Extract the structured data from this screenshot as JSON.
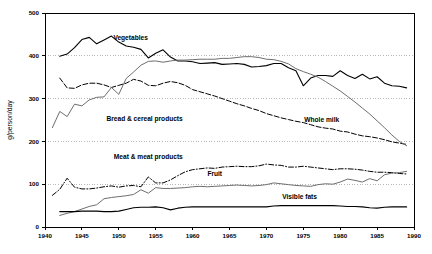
{
  "chart_data": {
    "type": "line",
    "title": "",
    "xlabel": "",
    "ylabel": "g/person/day",
    "xlim": [
      1940,
      1990
    ],
    "ylim": [
      0,
      500
    ],
    "xticks": [
      1940,
      1945,
      1950,
      1955,
      1960,
      1965,
      1970,
      1975,
      1980,
      1985,
      1990
    ],
    "yticks": [
      0,
      100,
      200,
      300,
      400,
      500
    ],
    "xtick_labels": [
      "1940",
      "1945",
      "1950",
      "1955",
      "1960",
      "1965",
      "1970",
      "1975",
      "1980",
      "1985",
      "1990"
    ],
    "ytick_labels": [
      "0",
      "100",
      "200",
      "300",
      "400",
      "500"
    ],
    "grid": "horizontal-dotted",
    "legend": "inline-annotations",
    "series": [
      {
        "name": "Vegetables",
        "label": "Vegetables",
        "color": "#000000",
        "style": "solid",
        "width": 1.1,
        "label_x": 1951.6,
        "label_y": 437,
        "x": [
          1942,
          1943,
          1944,
          1945,
          1946,
          1947,
          1948,
          1949,
          1950,
          1951,
          1952,
          1953,
          1954,
          1955,
          1956,
          1957,
          1958,
          1959,
          1960,
          1961,
          1962,
          1963,
          1964,
          1965,
          1966,
          1967,
          1968,
          1969,
          1970,
          1971,
          1972,
          1973,
          1974,
          1975,
          1976,
          1977,
          1978,
          1979,
          1980,
          1981,
          1982,
          1983,
          1984,
          1985,
          1986,
          1987,
          1988,
          1989
        ],
        "values": [
          399,
          404,
          419,
          438,
          443,
          428,
          437,
          446,
          432,
          423,
          420,
          415,
          395,
          406,
          414,
          397,
          388,
          388,
          386,
          382,
          383,
          384,
          380,
          381,
          382,
          380,
          374,
          375,
          377,
          382,
          382,
          372,
          365,
          330,
          348,
          354,
          354,
          352,
          365,
          354,
          347,
          357,
          346,
          351,
          336,
          330,
          329,
          325
        ]
      },
      {
        "name": "Bread & cereal products",
        "label": "Bread & cereal products",
        "color": "#000000",
        "style": "dashed",
        "width": 1.0,
        "label_x": 1953.5,
        "label_y": 248,
        "x": [
          1942,
          1943,
          1944,
          1945,
          1946,
          1947,
          1948,
          1949,
          1950,
          1951,
          1952,
          1953,
          1954,
          1955,
          1956,
          1957,
          1958,
          1959,
          1960,
          1961,
          1962,
          1963,
          1964,
          1965,
          1966,
          1967,
          1968,
          1969,
          1970,
          1971,
          1972,
          1973,
          1974,
          1975,
          1976,
          1977,
          1978,
          1979,
          1980,
          1981,
          1982,
          1983,
          1984,
          1985,
          1986,
          1987,
          1988,
          1989
        ],
        "values": [
          348,
          325,
          324,
          332,
          336,
          336,
          332,
          326,
          331,
          336,
          345,
          341,
          331,
          330,
          336,
          340,
          337,
          331,
          321,
          316,
          311,
          306,
          300,
          294,
          288,
          283,
          277,
          272,
          265,
          260,
          255,
          251,
          247,
          244,
          239,
          234,
          231,
          229,
          224,
          222,
          217,
          213,
          211,
          208,
          204,
          199,
          196,
          193
        ]
      },
      {
        "name": "Whole milk",
        "label": "Whole milk",
        "color": "#6e6e6e",
        "style": "solid",
        "width": 1.0,
        "label_x": 1977.5,
        "label_y": 246,
        "x": [
          1941,
          1942,
          1943,
          1944,
          1945,
          1946,
          1947,
          1948,
          1949,
          1950,
          1951,
          1952,
          1953,
          1954,
          1955,
          1956,
          1957,
          1958,
          1959,
          1960,
          1961,
          1962,
          1963,
          1964,
          1965,
          1966,
          1967,
          1968,
          1969,
          1970,
          1971,
          1972,
          1973,
          1974,
          1975,
          1976,
          1977,
          1978,
          1979,
          1980,
          1981,
          1982,
          1983,
          1984,
          1985,
          1986,
          1987,
          1988,
          1989
        ],
        "values": [
          232,
          270,
          258,
          287,
          283,
          297,
          303,
          304,
          326,
          310,
          347,
          362,
          378,
          387,
          388,
          385,
          388,
          390,
          390,
          391,
          392,
          392,
          392,
          394,
          394,
          396,
          398,
          398,
          396,
          392,
          391,
          387,
          381,
          370,
          363,
          357,
          350,
          340,
          329,
          318,
          305,
          292,
          278,
          264,
          248,
          232,
          215,
          200,
          190
        ]
      },
      {
        "name": "Meat & meat products",
        "label": "Meat & meat products",
        "color": "#000000",
        "style": "dashdot",
        "width": 1.0,
        "label_x": 1954.0,
        "label_y": 160,
        "x": [
          1941,
          1942,
          1943,
          1944,
          1945,
          1946,
          1947,
          1948,
          1949,
          1950,
          1951,
          1952,
          1953,
          1954,
          1955,
          1956,
          1957,
          1958,
          1959,
          1960,
          1961,
          1962,
          1963,
          1964,
          1965,
          1966,
          1967,
          1968,
          1969,
          1970,
          1971,
          1972,
          1973,
          1974,
          1975,
          1976,
          1977,
          1978,
          1979,
          1980,
          1981,
          1982,
          1983,
          1984,
          1985,
          1986,
          1987,
          1988,
          1989
        ],
        "values": [
          74,
          88,
          114,
          93,
          89,
          89,
          91,
          94,
          96,
          93,
          96,
          97,
          94,
          117,
          103,
          103,
          110,
          120,
          129,
          134,
          136,
          138,
          137,
          140,
          141,
          142,
          141,
          141,
          143,
          147,
          145,
          144,
          140,
          140,
          142,
          140,
          138,
          136,
          134,
          136,
          136,
          135,
          133,
          130,
          128,
          128,
          127,
          125,
          124
        ]
      },
      {
        "name": "Fruit",
        "label": "Fruit",
        "color": "#6e6e6e",
        "style": "solid",
        "width": 1.0,
        "label_x": 1963.0,
        "label_y": 120,
        "x": [
          1942,
          1943,
          1944,
          1945,
          1946,
          1947,
          1948,
          1949,
          1950,
          1951,
          1952,
          1953,
          1954,
          1955,
          1956,
          1957,
          1958,
          1959,
          1960,
          1961,
          1962,
          1963,
          1964,
          1965,
          1966,
          1967,
          1968,
          1969,
          1970,
          1971,
          1972,
          1973,
          1974,
          1975,
          1976,
          1977,
          1978,
          1979,
          1980,
          1981,
          1982,
          1983,
          1984,
          1985,
          1986,
          1987,
          1988,
          1989
        ],
        "values": [
          27,
          32,
          36,
          42,
          48,
          52,
          66,
          69,
          71,
          73,
          76,
          87,
          79,
          92,
          90,
          90,
          91,
          92,
          94,
          95,
          94,
          95,
          96,
          97,
          98,
          97,
          96,
          97,
          99,
          103,
          101,
          99,
          97,
          96,
          95,
          99,
          101,
          100,
          105,
          112,
          109,
          105,
          113,
          108,
          122,
          126,
          127,
          130
        ]
      },
      {
        "name": "Visible fats",
        "label": "Visible fats",
        "color": "#000000",
        "style": "solid",
        "width": 1.1,
        "label_x": 1974.5,
        "label_y": 66,
        "x": [
          1942,
          1943,
          1944,
          1945,
          1946,
          1947,
          1948,
          1949,
          1950,
          1951,
          1952,
          1953,
          1954,
          1955,
          1956,
          1957,
          1958,
          1959,
          1960,
          1961,
          1962,
          1963,
          1964,
          1965,
          1966,
          1967,
          1968,
          1969,
          1970,
          1971,
          1972,
          1973,
          1974,
          1975,
          1976,
          1977,
          1978,
          1979,
          1980,
          1981,
          1982,
          1983,
          1984,
          1985,
          1986,
          1987,
          1988,
          1989
        ],
        "values": [
          36,
          36,
          36,
          37,
          37,
          37,
          36,
          36,
          37,
          41,
          45,
          46,
          46,
          47,
          45,
          40,
          44,
          46,
          47,
          47,
          47,
          47,
          47,
          47,
          47,
          47,
          47,
          47,
          47,
          49,
          50,
          50,
          50,
          50,
          50,
          50,
          50,
          50,
          49,
          48,
          48,
          47,
          45,
          44,
          46,
          47,
          47,
          47
        ]
      }
    ]
  },
  "plot": {
    "area": {
      "left": 45,
      "top": 13,
      "right": 414,
      "bottom": 227
    }
  }
}
